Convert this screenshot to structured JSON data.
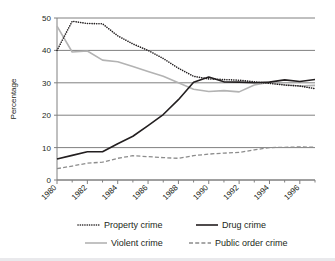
{
  "chart_data": {
    "type": "line",
    "title": "",
    "xlabel": "",
    "ylabel": "Percentage",
    "xlim": [
      1980,
      1997
    ],
    "ylim": [
      0,
      50
    ],
    "yticks": [
      0,
      10,
      20,
      30,
      40,
      50
    ],
    "ytick_labels": [
      "0",
      "10",
      "20",
      "30",
      "40",
      "50"
    ],
    "xticks": [
      1980,
      1982,
      1984,
      1986,
      1988,
      1990,
      1992,
      1994,
      1996
    ],
    "xtick_labels": [
      "1980",
      "1982",
      "1984",
      "1986",
      "1988",
      "1990",
      "1992",
      "1994",
      "1996"
    ],
    "minor_xticks": [
      1981,
      1983,
      1985,
      1987,
      1989,
      1991,
      1993,
      1995,
      1997
    ],
    "grid": "horizontal",
    "legend_position": "bottom",
    "x": [
      1980,
      1981,
      1982,
      1983,
      1984,
      1985,
      1986,
      1987,
      1988,
      1989,
      1990,
      1991,
      1992,
      1993,
      1994,
      1995,
      1996,
      1997
    ],
    "series": [
      {
        "name": "Property crime",
        "style": "dotted",
        "color": "#231f20",
        "values": [
          40.0,
          49.0,
          48.3,
          48.2,
          44.5,
          42.0,
          40.0,
          37.5,
          34.5,
          32.0,
          31.2,
          31.0,
          30.8,
          30.3,
          29.8,
          29.3,
          29.0,
          28.2
        ]
      },
      {
        "name": "Drug crime",
        "style": "solid",
        "color": "#231f20",
        "values": [
          6.5,
          7.6,
          8.7,
          8.7,
          11.2,
          13.5,
          16.8,
          20.2,
          24.8,
          30.2,
          31.8,
          30.3,
          30.2,
          30.0,
          30.2,
          30.9,
          30.4,
          31.0
        ]
      },
      {
        "name": "Violent crime",
        "style": "solid",
        "color": "#b3b3b3",
        "values": [
          47.5,
          39.5,
          39.8,
          37.0,
          36.5,
          35.0,
          33.5,
          32.0,
          30.0,
          28.0,
          27.3,
          27.6,
          27.2,
          29.3,
          30.2,
          29.4,
          29.0,
          29.2
        ]
      },
      {
        "name": "Public order crime",
        "style": "dashed",
        "color": "#8c8c8c",
        "values": [
          3.5,
          4.3,
          5.2,
          5.5,
          6.7,
          7.5,
          7.2,
          6.9,
          6.7,
          7.5,
          8.0,
          8.3,
          8.5,
          9.3,
          10.0,
          10.1,
          10.2,
          10.1
        ]
      }
    ],
    "legend": [
      {
        "label": "Property crime",
        "style": "dotted",
        "color": "#231f20"
      },
      {
        "label": "Drug crime",
        "style": "solid",
        "color": "#231f20"
      },
      {
        "label": "Violent crime",
        "style": "solid",
        "color": "#b3b3b3"
      },
      {
        "label": "Public order crime",
        "style": "dashed",
        "color": "#8c8c8c"
      }
    ]
  }
}
